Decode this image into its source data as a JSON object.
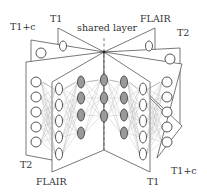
{
  "figure": {
    "title": "shared layer",
    "center": [
      104,
      52
    ],
    "labels": {
      "top": [
        {
          "id": "t1c-top",
          "text": "T1+c",
          "x": 10,
          "y": 30
        },
        {
          "id": "t1-top",
          "text": "T1",
          "x": 50,
          "y": 22
        },
        {
          "id": "shared",
          "text": "shared layer",
          "x": 77,
          "y": 31
        },
        {
          "id": "flair-top",
          "text": "FLAIR",
          "x": 140,
          "y": 22
        },
        {
          "id": "t2-top",
          "text": "T2",
          "x": 177,
          "y": 36
        }
      ],
      "bottom": [
        {
          "id": "t2-bottom",
          "text": "T2",
          "x": 20,
          "y": 168
        },
        {
          "id": "flair-bottom",
          "text": "FLAIR",
          "x": 36,
          "y": 185
        },
        {
          "id": "t1-bottom",
          "text": "T1",
          "x": 147,
          "y": 185
        },
        {
          "id": "t1c-bottom",
          "text": "T1+c",
          "x": 171,
          "y": 174
        }
      ]
    },
    "modalities": [
      "T1",
      "T1+c",
      "T2",
      "FLAIR"
    ],
    "pages": [
      {
        "name": "t1-input-sheet",
        "points": "58,28 104,52 58,52"
      },
      {
        "name": "t1c-input-sheet",
        "points": "31,40 104,52 31,90"
      },
      {
        "name": "flair-output-sheet",
        "points": "155,28 104,52 155,52"
      },
      {
        "name": "t2-output-sheet",
        "points": "180,48 104,52 180,128"
      },
      {
        "name": "t2-input-sheet",
        "points": "26,62 104,52 52,160 26,155"
      },
      {
        "name": "t1c-output-sheet",
        "points": "182,64 104,52 182,126 157,158"
      },
      {
        "name": "flair-input-sheet",
        "points": "52,82 104,52 104,150 52,172"
      },
      {
        "name": "t1-output-sheet",
        "points": "150,82 104,52 104,150 150,172"
      }
    ],
    "layers": [
      {
        "name": "t2-input-layer",
        "x": 36,
        "ys": [
          82,
          97,
          112,
          127,
          142
        ],
        "shaded": false,
        "rx": 5,
        "ry": 5
      },
      {
        "name": "flair-input-layer",
        "x": 59,
        "ys": [
          89,
          105,
          121,
          137,
          154
        ],
        "shaded": false,
        "rx": 3.5,
        "ry": 6
      },
      {
        "name": "hidden-layer-1",
        "x": 81,
        "ys": [
          82,
          98,
          115,
          133
        ],
        "shaded": true,
        "rx": 3.5,
        "ry": 6
      },
      {
        "name": "shared-layer",
        "x": 104,
        "ys": [
          80,
          98,
          116
        ],
        "shaded": true,
        "rx": 3.5,
        "ry": 6
      },
      {
        "name": "hidden-layer-2",
        "x": 124,
        "ys": [
          82,
          98,
          115,
          133
        ],
        "shaded": true,
        "rx": 3.5,
        "ry": 6
      },
      {
        "name": "t1-output-layer",
        "x": 143,
        "ys": [
          89,
          105,
          121,
          137,
          154
        ],
        "shaded": false,
        "rx": 3.5,
        "ry": 6
      },
      {
        "name": "t1c-output-layer",
        "x": 167,
        "ys": [
          82,
          97,
          112,
          127,
          142
        ],
        "shaded": false,
        "rx": 5,
        "ry": 5
      }
    ],
    "top_nodes": [
      {
        "name": "t1-top-node",
        "x": 63,
        "y": 46,
        "rx": 3.5,
        "ry": 5
      },
      {
        "name": "t1c-top-node",
        "x": 41,
        "y": 53,
        "rx": 5,
        "ry": 5
      },
      {
        "name": "flair-top-node",
        "x": 149,
        "y": 46,
        "rx": 3.5,
        "ry": 5
      },
      {
        "name": "t2-top-node",
        "x": 170,
        "y": 59,
        "rx": 5,
        "ry": 5
      }
    ]
  }
}
